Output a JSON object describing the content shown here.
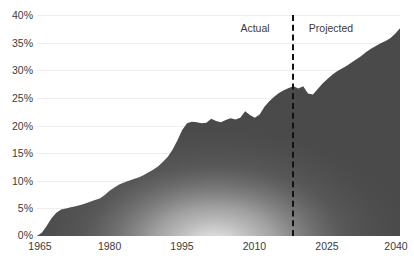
{
  "chart_data": {
    "type": "area",
    "title": "",
    "xlabel": "",
    "ylabel": "",
    "grid": true,
    "legend_position": "inline-annotations",
    "xlim": [
      1965,
      2040
    ],
    "ylim": [
      0,
      40
    ],
    "y_tick_labels": [
      "40%",
      "35%",
      "30%",
      "25%",
      "20%",
      "15%",
      "10%",
      "5%",
      "0%"
    ],
    "y_tick_values": [
      40,
      35,
      30,
      25,
      20,
      15,
      10,
      5,
      0
    ],
    "x_tick_labels": [
      "1965",
      "1980",
      "1995",
      "2010",
      "2025",
      "2040"
    ],
    "x_tick_values": [
      1965,
      1980,
      1995,
      2010,
      2025,
      2040
    ],
    "annotations": [
      {
        "text": "Actual",
        "at_x": 2005
      },
      {
        "text": "Projected",
        "at_x": 2030
      }
    ],
    "divider_x": 2020,
    "divider_style": "dashed",
    "area_color": "#4a4a4a",
    "series": [
      {
        "name": "Share",
        "x": [
          1965,
          1966,
          1967,
          1968,
          1969,
          1970,
          1971,
          1972,
          1973,
          1974,
          1975,
          1976,
          1977,
          1978,
          1979,
          1980,
          1981,
          1982,
          1983,
          1984,
          1985,
          1986,
          1987,
          1988,
          1989,
          1990,
          1991,
          1992,
          1993,
          1994,
          1995,
          1996,
          1997,
          1998,
          1999,
          2000,
          2001,
          2002,
          2003,
          2004,
          2005,
          2006,
          2007,
          2008,
          2009,
          2010,
          2011,
          2012,
          2013,
          2014,
          2015,
          2016,
          2017,
          2018,
          2019,
          2020,
          2021,
          2022,
          2023,
          2024,
          2025,
          2026,
          2027,
          2028,
          2029,
          2030,
          2031,
          2032,
          2033,
          2034,
          2035,
          2036,
          2037,
          2038,
          2039,
          2040
        ],
        "values": [
          0.0,
          0.6,
          1.8,
          3.2,
          4.2,
          4.8,
          5.0,
          5.2,
          5.4,
          5.6,
          5.9,
          6.2,
          6.5,
          6.8,
          7.4,
          8.2,
          8.8,
          9.3,
          9.7,
          10.0,
          10.3,
          10.6,
          11.0,
          11.5,
          12.0,
          12.6,
          13.4,
          14.3,
          15.6,
          17.3,
          19.2,
          20.4,
          20.7,
          20.6,
          20.4,
          20.5,
          21.2,
          20.8,
          20.6,
          21.0,
          21.3,
          21.1,
          21.4,
          22.6,
          21.9,
          21.4,
          22.0,
          23.4,
          24.4,
          25.2,
          25.9,
          26.4,
          26.8,
          27.1,
          26.7,
          27.1,
          25.8,
          25.6,
          26.6,
          27.6,
          28.4,
          29.2,
          29.8,
          30.3,
          30.8,
          31.4,
          32.0,
          32.6,
          33.3,
          33.9,
          34.4,
          34.9,
          35.3,
          35.8,
          36.6,
          37.6
        ]
      }
    ]
  }
}
